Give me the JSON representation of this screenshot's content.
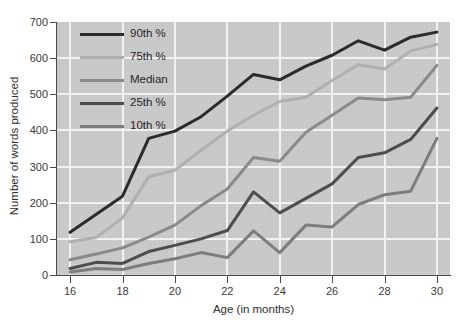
{
  "chart_data": {
    "type": "line",
    "title": "",
    "xlabel": "Age (in months)",
    "ylabel": "Number of words produced",
    "x": [
      16,
      17,
      18,
      19,
      20,
      21,
      22,
      23,
      24,
      25,
      26,
      27,
      28,
      29,
      30
    ],
    "xlim": [
      15.5,
      30.5
    ],
    "ylim": [
      0,
      700
    ],
    "xticks": [
      "16",
      "18",
      "20",
      "22",
      "24",
      "26",
      "28",
      "30"
    ],
    "yticks": [
      "0",
      "100",
      "200",
      "300",
      "400",
      "500",
      "600",
      "700"
    ],
    "grid": true,
    "legend_position": "upper-left-inside",
    "plot_background": "#c9c9c9",
    "grid_color": "#f2f2f2",
    "series": [
      {
        "name": "90th %",
        "color": "#2b2b2b",
        "width": 3.0,
        "values": [
          118,
          168,
          218,
          378,
          398,
          438,
          495,
          555,
          540,
          578,
          608,
          648,
          622,
          658,
          672
        ]
      },
      {
        "name": "75th %",
        "color": "#b0b0b0",
        "width": 3.0,
        "values": [
          92,
          104,
          158,
          272,
          290,
          345,
          398,
          442,
          480,
          492,
          538,
          582,
          570,
          620,
          638
        ]
      },
      {
        "name": "Median",
        "color": "#8a8a8a",
        "width": 3.0,
        "values": [
          42,
          58,
          75,
          105,
          138,
          192,
          238,
          325,
          315,
          395,
          442,
          490,
          485,
          492,
          580
        ]
      },
      {
        "name": "25th %",
        "color": "#4d4d4d",
        "width": 3.0,
        "values": [
          18,
          35,
          32,
          65,
          82,
          100,
          123,
          230,
          172,
          212,
          252,
          325,
          338,
          375,
          462
        ]
      },
      {
        "name": "10th %",
        "color": "#7d7d7d",
        "width": 3.0,
        "values": [
          8,
          18,
          15,
          32,
          45,
          62,
          48,
          122,
          62,
          138,
          133,
          195,
          222,
          232,
          378
        ]
      }
    ]
  },
  "legend": {
    "items": [
      {
        "label": "90th %",
        "color": "#2b2b2b"
      },
      {
        "label": "75th %",
        "color": "#b0b0b0"
      },
      {
        "label": "Median",
        "color": "#8a8a8a"
      },
      {
        "label": "25th %",
        "color": "#4d4d4d"
      },
      {
        "label": "10th %",
        "color": "#7d7d7d"
      }
    ]
  }
}
